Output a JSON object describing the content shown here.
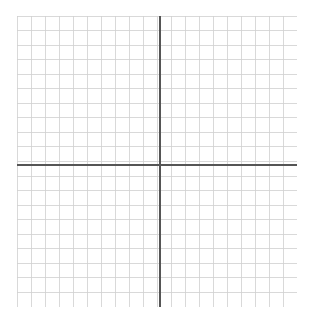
{
  "canvas": {
    "width": 315,
    "height": 322,
    "background": "#ffffff"
  },
  "chart_data": {
    "type": "grid",
    "title": "",
    "subtitle": "",
    "xlabel": "",
    "ylabel": "",
    "grid": {
      "visible": true,
      "columns": 20,
      "rows": 20,
      "cell_width": 14.0,
      "cell_height": 14.55,
      "line_color": "#cfcfcf",
      "line_width": 0.8,
      "left": 17,
      "top": 16,
      "width": 280,
      "height": 291
    },
    "axes": {
      "x_axis": {
        "visible": true,
        "orientation": "horizontal",
        "position_px": 149,
        "position_cells_from_top": 10.24,
        "color": "#555555",
        "line_width": 1.2,
        "ticks": [],
        "tick_labels": [],
        "label": ""
      },
      "y_axis": {
        "visible": true,
        "orientation": "vertical",
        "position_px": 143,
        "position_cells_from_left": 10.2,
        "color": "#555555",
        "line_width": 1.2,
        "ticks": [],
        "tick_labels": [],
        "label": ""
      }
    },
    "xlim": [
      -10,
      10
    ],
    "ylim": [
      -10,
      10
    ],
    "series": [],
    "legend": {
      "visible": false,
      "position": "none",
      "entries": []
    },
    "annotations": []
  }
}
